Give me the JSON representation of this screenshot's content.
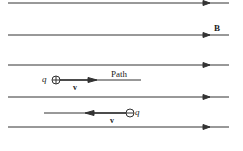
{
  "field": {
    "label": "B",
    "line_ys": [
      3,
      35,
      65,
      97,
      127
    ],
    "x_start": 8,
    "x_end": 229,
    "arrow_x": 207
  },
  "positive_charge": {
    "symbol": "q",
    "sign": "+",
    "velocity_label": "v",
    "path_label": "Path"
  },
  "negative_charge": {
    "symbol": "q",
    "sign": "−",
    "velocity_label": "v"
  },
  "colors": {
    "line": "#333333"
  }
}
